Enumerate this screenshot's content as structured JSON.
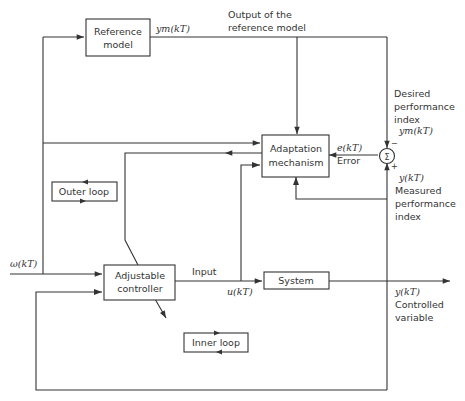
{
  "blocks": {
    "reference_model": [
      "Reference",
      "model"
    ],
    "adaptation_mechanism": [
      "Adaptation",
      "mechanism"
    ],
    "adjustable_controller": [
      "Adjustable",
      "controller"
    ],
    "system": "System",
    "outer_loop": "Outer loop",
    "inner_loop": "Inner loop",
    "summer": "Σ"
  },
  "signals": {
    "ym_top": "ym(kT)",
    "output_ref_label": [
      "Output of the",
      "reference model"
    ],
    "desired_perf": [
      "Desired",
      "performance",
      "index"
    ],
    "ym_sum": "ym(kT)",
    "error_sym": "e(kT)",
    "error_label": "Error",
    "sign_minus": "−",
    "sign_plus": "+",
    "y_sum": "y(kT)",
    "measured_perf": [
      "Measured",
      "performance",
      "index"
    ],
    "omega": "ω(kT)",
    "input_label": "Input",
    "u": "u(kT)",
    "y_out": "y(kT)",
    "controlled_var": [
      "Controlled",
      "variable"
    ]
  }
}
